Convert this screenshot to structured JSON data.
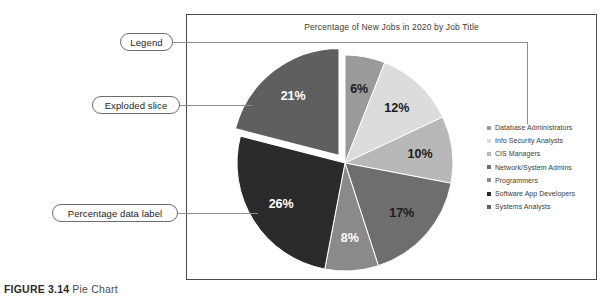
{
  "figure": {
    "caption_label": "FIGURE 3.14",
    "caption_text": "Pie Chart"
  },
  "chart_data": {
    "type": "pie",
    "title": "Percentage of New Jobs in 2020 by Job Title",
    "xlabel": "",
    "ylabel": "",
    "legend_position": "right",
    "grid": false,
    "exploded_slice": "Systems Analysts",
    "categories": [
      "Database Administrators",
      "Info Security Analysts",
      "CIS Managers",
      "Network/System Admins",
      "Programmers",
      "Software App Developers",
      "Systems Analysts"
    ],
    "values": [
      6,
      12,
      10,
      17,
      8,
      26,
      21
    ],
    "labels": [
      "6%",
      "12%",
      "10%",
      "17%",
      "8%",
      "26%",
      "21%"
    ],
    "colors": [
      "#9a9a9a",
      "#dcdcdc",
      "#b8b8b8",
      "#6e6e6e",
      "#8a8a8a",
      "#2b2b2b",
      "#5f5f5f"
    ],
    "label_colors": [
      "#1c1c1c",
      "#1c1c1c",
      "#1c1c1c",
      "#1c1c1c",
      "#ffffff",
      "#ffffff",
      "#ffffff"
    ]
  },
  "legend": {
    "items": [
      {
        "label": "Database Administrators",
        "color": "#9a9a9a"
      },
      {
        "label": "Info Security Analysts",
        "color": "#dcdcdc"
      },
      {
        "label": "CIS Managers",
        "color": "#b8b8b8"
      },
      {
        "label": "Network/System Admins",
        "color": "#6e6e6e"
      },
      {
        "label": "Programmers",
        "color": "#8a8a8a"
      },
      {
        "label": "Software App Developers",
        "color": "#2b2b2b"
      },
      {
        "label": "Systems Analysts",
        "color": "#5f5f5f"
      }
    ]
  },
  "callouts": {
    "legend": "Legend",
    "exploded": "Exploded slice",
    "datalabel": "Percentage data label"
  }
}
